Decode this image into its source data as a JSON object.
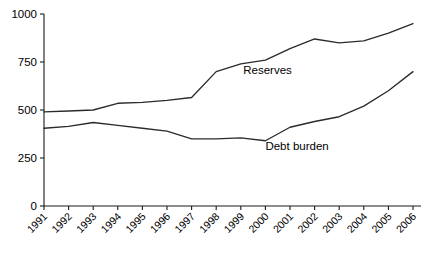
{
  "chart_data": {
    "type": "line",
    "title": "",
    "subtitle": "",
    "xlabel": "",
    "ylabel": "",
    "grid": false,
    "legend_position": "inline-annotation",
    "x": [
      1991,
      1992,
      1993,
      1994,
      1995,
      1996,
      1997,
      1998,
      1999,
      2000,
      2001,
      2002,
      2003,
      2004,
      2005,
      2006
    ],
    "categories": [
      "1991",
      "1992",
      "1993",
      "1994",
      "1995",
      "1996",
      "1997",
      "1998",
      "1999",
      "2000",
      "2001",
      "2002",
      "2003",
      "2004",
      "2005",
      "2006"
    ],
    "xlim": [
      1991,
      2006
    ],
    "ylim": [
      0,
      1000
    ],
    "yticks": [
      0,
      250,
      500,
      750,
      1000
    ],
    "ytick_labels": [
      "0",
      "250",
      "500",
      "750",
      "1000"
    ],
    "series": [
      {
        "name": "Reserves",
        "color": "#2b2b2b",
        "values": [
          490,
          495,
          500,
          535,
          540,
          550,
          565,
          700,
          740,
          760,
          820,
          870,
          850,
          860,
          900,
          950
        ]
      },
      {
        "name": "Debt burden",
        "color": "#2b2b2b",
        "values": [
          405,
          415,
          435,
          420,
          405,
          390,
          350,
          350,
          355,
          340,
          410,
          440,
          465,
          520,
          600,
          700
        ]
      }
    ],
    "annotations": [
      {
        "text": "Reserves",
        "x": 1999.1,
        "y": 690
      },
      {
        "text": "Debt burden",
        "x": 2000.0,
        "y": 290
      }
    ]
  }
}
